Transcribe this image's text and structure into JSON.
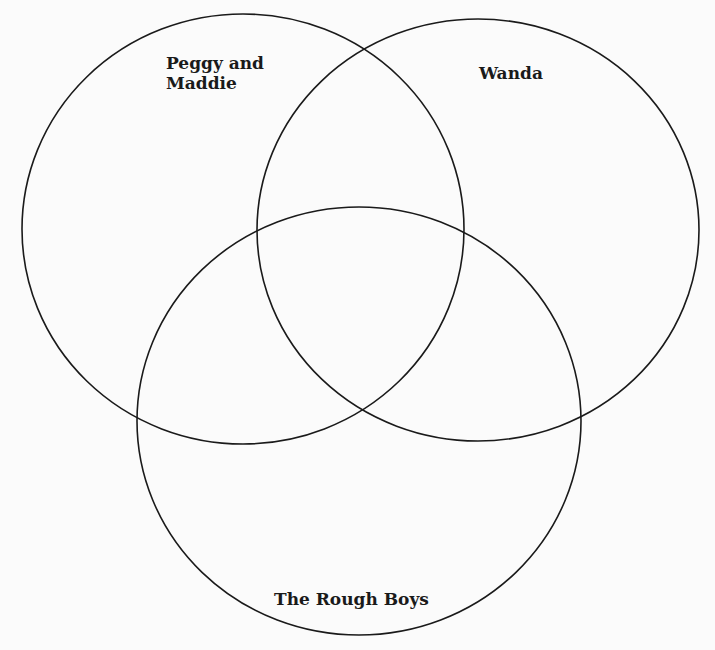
{
  "diagram": {
    "type": "venn",
    "stroke_color": "#1a1a1a",
    "background_color": "#fbfbfb",
    "sets": [
      {
        "id": "peggy-and-maddie",
        "label": "Peggy and\nMaddie",
        "cx": 243,
        "cy": 229,
        "rx": 221,
        "ry": 215
      },
      {
        "id": "wanda",
        "label": "Wanda",
        "cx": 478,
        "cy": 230,
        "rx": 221,
        "ry": 211
      },
      {
        "id": "the-rough-boys",
        "label": "The Rough Boys",
        "cx": 359,
        "cy": 421,
        "rx": 222,
        "ry": 214
      }
    ]
  }
}
